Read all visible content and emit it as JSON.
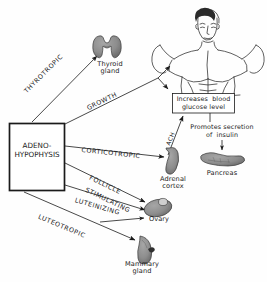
{
  "diagram": {
    "source_node": {
      "label": "ADENO-\nHYPOPHYSIS"
    },
    "hormone_arrows": [
      {
        "id": "thyrotropic",
        "label": "THYROTROPIC",
        "target": "Thyroid gland"
      },
      {
        "id": "growth",
        "label": "GROWTH",
        "target": "Body / Increases blood glucose level"
      },
      {
        "id": "corticotropic",
        "label": "CORTICOTROPIC",
        "target": "Adrenal cortex"
      },
      {
        "id": "follicle",
        "label": "FOLLICLE",
        "label2": "STIMULATING",
        "target": "Ovary"
      },
      {
        "id": "luteinizing",
        "label": "LUTEINIZING",
        "target": "Ovary"
      },
      {
        "id": "luteotropic",
        "label": "LUTEOTROPIC",
        "target": "Mammary gland"
      }
    ],
    "secondary_arrows": [
      {
        "id": "ach",
        "label": "ACH",
        "from": "Adrenal cortex",
        "to": "Increases blood glucose level"
      }
    ],
    "targets": [
      {
        "id": "thyroid",
        "name": "Thyroid\ngland"
      },
      {
        "id": "body",
        "name": ""
      },
      {
        "id": "adrenal",
        "name": "Adrenal\ncortex"
      },
      {
        "id": "pancreas",
        "name": "Pancreas"
      },
      {
        "id": "ovary",
        "name": "Ovary"
      },
      {
        "id": "mammary",
        "name": "Mammary\ngland"
      }
    ],
    "text_boxes": [
      {
        "id": "glucose-box",
        "text": "Increases  blood\nglucose level"
      }
    ],
    "annotations": [
      {
        "id": "insulin-note",
        "text": "Promotes secretion\nof  insulin"
      }
    ]
  },
  "colors": {
    "ink": "#1a1a1a",
    "organ_fill": "#8c8c8c",
    "organ_stroke": "#3a3a3a",
    "paper": "#fefefe"
  }
}
